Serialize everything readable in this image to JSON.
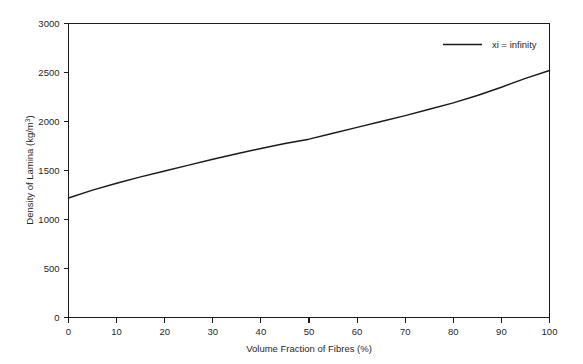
{
  "chart_data": {
    "type": "line",
    "title": "",
    "subtitle": "",
    "xlabel": "Volume Fraction of Fibres (%)",
    "ylabel": "Density of Lamina (kg/m",
    "ylabel_sup": "3",
    "ylabel_tail": ")",
    "ylabel_full": "Density of Lamina (kg/m3)",
    "xlim": [
      0,
      100
    ],
    "ylim": [
      0,
      3000
    ],
    "xticks": [
      0,
      10,
      20,
      30,
      40,
      50,
      60,
      70,
      80,
      90,
      100
    ],
    "xtick_labels": [
      "0",
      "10",
      "20",
      "30",
      "40",
      "50",
      "60",
      "70",
      "80",
      "90",
      "100"
    ],
    "yticks": [
      0,
      500,
      1000,
      1500,
      2000,
      2500,
      3000
    ],
    "ytick_labels": [
      "0",
      "500",
      "1000",
      "1500",
      "2000",
      "2500",
      "3000"
    ],
    "grid": false,
    "legend_position": "top-right",
    "legend": [
      "xi = infinity"
    ],
    "series": [
      {
        "name": "xi = infinity",
        "color": "#1a1a1a",
        "x": [
          0,
          5,
          10,
          15,
          20,
          25,
          30,
          35,
          40,
          45,
          50,
          55,
          60,
          65,
          70,
          75,
          80,
          85,
          90,
          95,
          100
        ],
        "values": [
          1220,
          1300,
          1370,
          1435,
          1495,
          1555,
          1615,
          1670,
          1725,
          1775,
          1820,
          1880,
          1940,
          2000,
          2060,
          2125,
          2190,
          2265,
          2350,
          2440,
          2520
        ]
      }
    ],
    "axis_color": "#1a1a1a",
    "background": "#ffffff"
  },
  "figure": {
    "alt": "Line chart of density of lamina versus volume fraction of fibres"
  }
}
